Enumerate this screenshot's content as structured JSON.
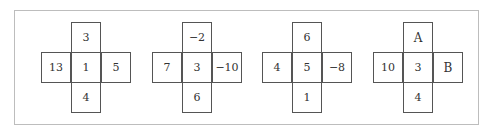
{
  "figure": {
    "crosses": [
      {
        "top": "3",
        "left": "13",
        "center": "1",
        "right": "5",
        "bottom": "4"
      },
      {
        "top": "−2",
        "left": "7",
        "center": "3",
        "right": "−10",
        "bottom": "6"
      },
      {
        "top": "6",
        "left": "4",
        "center": "5",
        "right": "−8",
        "bottom": "1"
      },
      {
        "top": "A",
        "left": "10",
        "center": "3",
        "right": "B",
        "bottom": "4"
      }
    ]
  }
}
